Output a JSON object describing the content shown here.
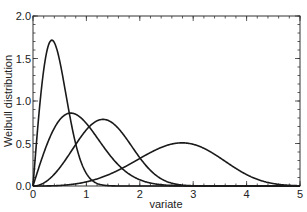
{
  "chart_data": {
    "type": "line",
    "title": "",
    "xlabel": "variate",
    "ylabel": "Weibull distribution",
    "xlim": [
      0,
      5
    ],
    "ylim": [
      0,
      2.0
    ],
    "xticks": [
      "0",
      "1",
      "2",
      "3",
      "4",
      "5"
    ],
    "yticks": [
      "0.0",
      "0.5",
      "1.0",
      "1.5",
      "2.0"
    ],
    "grid": false,
    "legend": null,
    "series": [
      {
        "name": "k=2, lambda=0.5",
        "k": 2,
        "lambda": 0.5,
        "peak": [
          0.35,
          1.71
        ]
      },
      {
        "name": "k=2, lambda=1",
        "k": 2,
        "lambda": 1,
        "peak": [
          0.71,
          0.86
        ]
      },
      {
        "name": "k=3, lambda=1.5",
        "k": 3,
        "lambda": 1.5,
        "peak": [
          1.31,
          0.78
        ]
      },
      {
        "name": "k=4, lambda=3",
        "k": 4,
        "lambda": 3,
        "peak": [
          2.79,
          0.5
        ]
      }
    ]
  }
}
